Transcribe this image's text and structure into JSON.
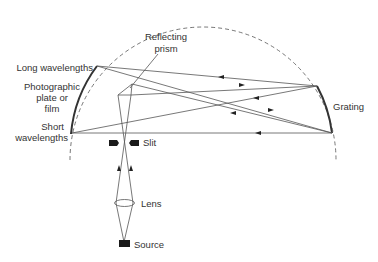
{
  "diagram": {
    "labels": {
      "reflecting_prism_line1": "Reflecting",
      "reflecting_prism_line2": "prism",
      "long_wavelengths": "Long wavelengths",
      "photographic_line1": "Photographic",
      "photographic_line2": "plate or",
      "photographic_line3": "film",
      "short_line1": "Short",
      "short_line2": "wavelengths",
      "slit": "Slit",
      "grating": "Grating",
      "lens": "Lens",
      "source": "Source"
    },
    "components": [
      "Rowland circle",
      "Photographic plate or film",
      "Grating",
      "Reflecting prism",
      "Slit",
      "Lens",
      "Source"
    ],
    "colors": {
      "line": "#444444",
      "fill": "#1a1a1a",
      "text": "#333333"
    }
  }
}
